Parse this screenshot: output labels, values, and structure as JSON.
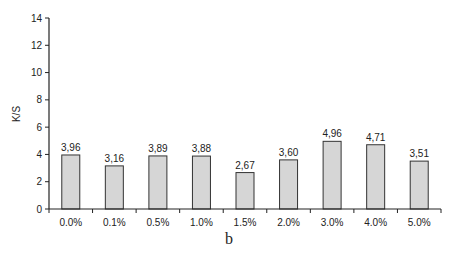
{
  "chart_data": {
    "type": "bar",
    "title": "",
    "caption": "b",
    "xlabel": "",
    "ylabel": "K/S",
    "ylim": [
      0,
      14
    ],
    "yticks": [
      0,
      2,
      4,
      6,
      8,
      10,
      12,
      14
    ],
    "grid": false,
    "legend": null,
    "categories": [
      "0.0%",
      "0.1%",
      "0.5%",
      "1.0%",
      "1.5%",
      "2.0%",
      "3.0%",
      "4.0%",
      "5.0%"
    ],
    "values": [
      3.96,
      3.16,
      3.89,
      3.88,
      2.67,
      3.6,
      4.96,
      4.71,
      3.51
    ],
    "value_labels": [
      "3,96",
      "3,16",
      "3,89",
      "3,88",
      "2,67",
      "3,60",
      "4,96",
      "4,71",
      "3,51"
    ],
    "colors": {
      "bar_fill": "#d6d6d6",
      "bar_stroke": "#333333",
      "axis": "#222222"
    }
  }
}
